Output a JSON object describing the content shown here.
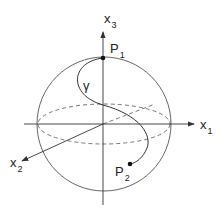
{
  "diagram": {
    "axes": {
      "x1": {
        "label": "x",
        "subscript": "1"
      },
      "x2": {
        "label": "x",
        "subscript": "2"
      },
      "x3": {
        "label": "x",
        "subscript": "3"
      }
    },
    "points": {
      "P1": {
        "label": "P",
        "subscript": "1"
      },
      "P2": {
        "label": "P",
        "subscript": "2"
      }
    },
    "curve": {
      "label": "γ"
    },
    "colors": {
      "stroke": "#333333",
      "background": "#ffffff"
    }
  }
}
